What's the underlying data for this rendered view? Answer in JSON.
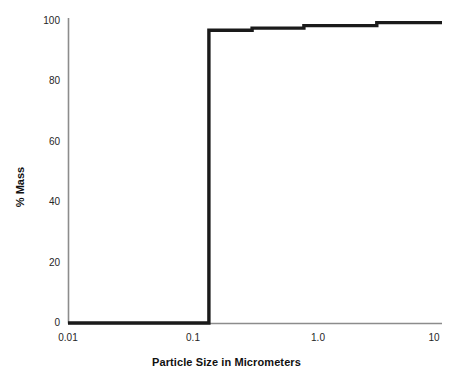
{
  "chart_data": {
    "type": "line",
    "subtype": "step-cumulative",
    "title": "",
    "xlabel": "Particle Size in Micrometers",
    "ylabel": "% Mass",
    "xscale": "log",
    "yscale": "linear",
    "xlim": [
      0.01,
      10
    ],
    "ylim": [
      0,
      100
    ],
    "grid": false,
    "legend": null,
    "xticks": [
      "0.01",
      "0.1",
      "1.0",
      "10"
    ],
    "xtick_values": [
      0.01,
      0.1,
      1.0,
      10
    ],
    "yticks": [
      "0",
      "20",
      "40",
      "60",
      "80",
      "100"
    ],
    "ytick_values": [
      0,
      20,
      40,
      60,
      80,
      100
    ],
    "series": [
      {
        "name": "Cumulative % Mass",
        "x": [
          0.01,
          0.135,
          0.135,
          0.3,
          0.3,
          0.78,
          0.78,
          3.0,
          3.0,
          10
        ],
        "y": [
          0,
          0,
          96.0,
          96.0,
          96.7,
          96.7,
          97.5,
          97.5,
          98.5,
          98.5
        ]
      }
    ],
    "steps": [
      {
        "x_start": 0.01,
        "x_end": 0.135,
        "value": 0
      },
      {
        "x_start": 0.135,
        "x_end": 0.3,
        "value": 96.0
      },
      {
        "x_start": 0.3,
        "x_end": 0.78,
        "value": 96.7
      },
      {
        "x_start": 0.78,
        "x_end": 3.0,
        "value": 97.5
      },
      {
        "x_start": 3.0,
        "x_end": 10,
        "value": 98.5
      }
    ],
    "colors": {
      "line": "#1a1a1a",
      "axis": "#808080",
      "background": "#ffffff",
      "text": "#1a1a1a"
    }
  }
}
